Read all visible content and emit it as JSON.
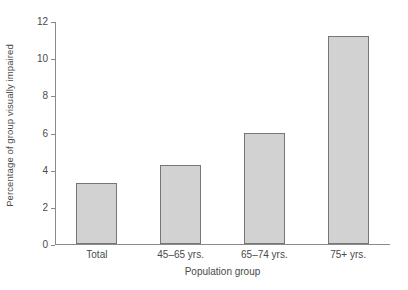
{
  "chart_data": {
    "type": "bar",
    "title": "",
    "xlabel": "Population group",
    "ylabel": "Percentage of group visually impaired",
    "categories": [
      "Total",
      "45–65 yrs.",
      "65–74 yrs.",
      "75+ yrs."
    ],
    "values": [
      3.3,
      4.25,
      6.0,
      11.2
    ],
    "ylim": [
      0,
      12
    ],
    "yticks": [
      0,
      2,
      4,
      6,
      8,
      10,
      12
    ],
    "ytick_labels": [
      "0",
      "2",
      "4",
      "6",
      "8",
      "10",
      "12"
    ],
    "grid": false,
    "legend": "none",
    "bar_fill_color": "#d2d2d2",
    "bar_border_color": "#767676",
    "axis_color": "#8a8a8a"
  }
}
